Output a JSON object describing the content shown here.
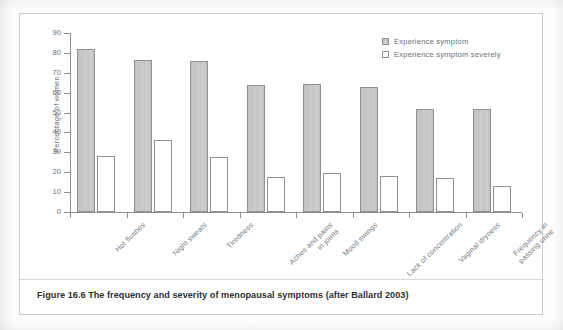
{
  "figure": {
    "caption": "Figure 16.6  The frequency and severity of menopausal symptoms (after Ballard 2003)"
  },
  "chart_data": {
    "type": "bar",
    "title": "",
    "xlabel": "",
    "ylabel": "Percentage of women",
    "ylim": [
      0,
      90
    ],
    "ytick_step": 10,
    "grid": false,
    "legend_position": "top-right",
    "categories": [
      "Hot flushes",
      "Night sweats",
      "Tiredness",
      "Aches and pains\nin joints",
      "Mood swings",
      "Lack of concentration",
      "Vaginal dryness",
      "Frequency in\npassing urine"
    ],
    "ticks": [
      "0",
      "10",
      "20",
      "30",
      "40",
      "50",
      "60",
      "70",
      "80",
      "90"
    ],
    "series": [
      {
        "name": "Experience symptom",
        "style": "filled",
        "color": "#c7c7c7",
        "values": [
          82,
          76.5,
          76,
          64,
          64.5,
          63,
          52,
          52
        ]
      },
      {
        "name": "Experience symptom severely",
        "style": "hollow",
        "color": "#ffffff",
        "values": [
          28,
          36,
          27.5,
          17.5,
          19.5,
          18,
          17,
          13
        ]
      }
    ]
  }
}
